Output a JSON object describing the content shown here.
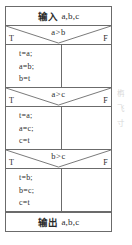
{
  "diagram": {
    "type": "nassi-shneiderman-flowchart",
    "title_visible": false,
    "border_color": "#6b6b6b",
    "background_color": "#ffffff",
    "text_color": "#2b2b2b"
  },
  "input_row": {
    "keyword": "输入",
    "variables": "a,b,c"
  },
  "output_row": {
    "keyword": "输出",
    "variables": "a,b,c"
  },
  "branch_labels": {
    "true": "T",
    "false": "F"
  },
  "conditions": [
    {
      "expression": "a>b"
    },
    {
      "expression": "a>c"
    },
    {
      "expression": "b>c"
    }
  ],
  "statement_blocks": [
    {
      "lines": [
        "t=a;",
        "a=b;",
        "b=t"
      ]
    },
    {
      "lines": [
        "t=a;",
        "a=c;",
        "c=t"
      ]
    },
    {
      "lines": [
        "t=b;",
        "b=c;",
        "c=t"
      ]
    }
  ],
  "margin_notes": {
    "lines": [
      "栴",
      "飞",
      "寸"
    ]
  }
}
